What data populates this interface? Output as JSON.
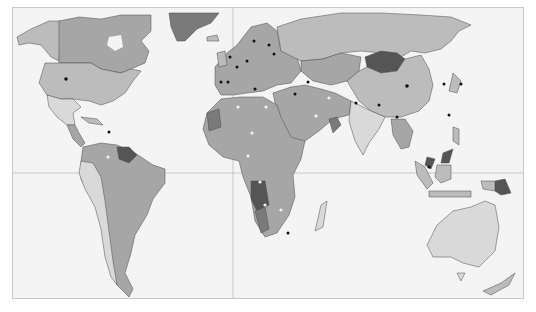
{
  "map": {
    "type": "world-political-choropleth",
    "projection": "miller-like",
    "palette": {
      "ocean": "#f4f4f4",
      "frame": "#c8c8c8",
      "gridline": "#bdbdbd",
      "border": "#4a4a4a",
      "shade_lightest": "#d9d9d9",
      "shade_light": "#bcbcbc",
      "shade_mid": "#a6a6a6",
      "shade_dark": "#7a7a7a",
      "shade_darkest": "#555555",
      "marker_dark": "#111111",
      "marker_light": "#f2f2f2"
    },
    "gridlines": [
      "equator",
      "prime-meridian"
    ],
    "regions": [
      {
        "name": "greenland",
        "shade": "shade_dark"
      },
      {
        "name": "canada",
        "shade": "shade_mid"
      },
      {
        "name": "alaska",
        "shade": "shade_light"
      },
      {
        "name": "united-states",
        "shade": "shade_light",
        "marker": "dark"
      },
      {
        "name": "mexico",
        "shade": "shade_lightest"
      },
      {
        "name": "central-america",
        "shade": "shade_mid"
      },
      {
        "name": "south-america",
        "shade": "shade_mid"
      },
      {
        "name": "guianas",
        "shade": "shade_darkest"
      },
      {
        "name": "europe",
        "shade": "shade_mid",
        "markers": "dark"
      },
      {
        "name": "russia",
        "shade": "shade_light"
      },
      {
        "name": "mongolia",
        "shade": "shade_darkest"
      },
      {
        "name": "china",
        "shade": "shade_light",
        "marker": "dark"
      },
      {
        "name": "india",
        "shade": "shade_lightest"
      },
      {
        "name": "middle-east",
        "shade": "shade_mid",
        "markers": "light"
      },
      {
        "name": "africa",
        "shade": "shade_mid",
        "markers": "light"
      },
      {
        "name": "angola",
        "shade": "shade_darkest",
        "marker": "light"
      },
      {
        "name": "southeast-asia",
        "shade": "shade_mid"
      },
      {
        "name": "malaysia",
        "shade": "shade_darkest"
      },
      {
        "name": "papua-new-guinea",
        "shade": "shade_darkest"
      },
      {
        "name": "indonesia",
        "shade": "shade_light"
      },
      {
        "name": "australia",
        "shade": "shade_lightest"
      },
      {
        "name": "new-zealand",
        "shade": "shade_light"
      },
      {
        "name": "madagascar",
        "shade": "shade_lightest"
      },
      {
        "name": "japan",
        "shade": "shade_light",
        "marker": "dark"
      }
    ]
  }
}
